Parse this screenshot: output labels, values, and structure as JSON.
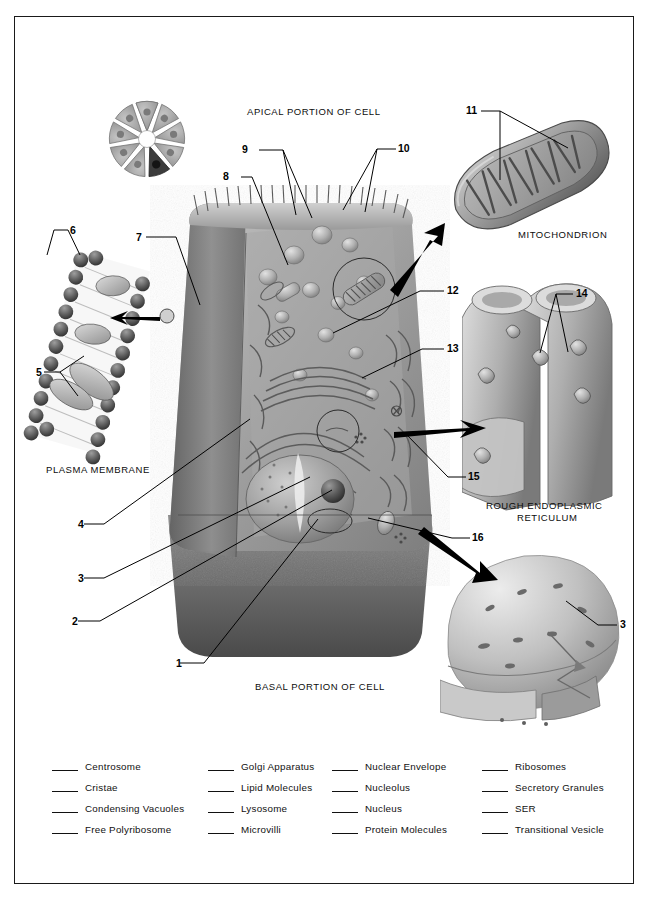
{
  "figure": {
    "orientation_labels": {
      "apical": "APICAL PORTION OF CELL",
      "basal": "BASAL PORTION OF CELL"
    },
    "inset_titles": {
      "mitochondrion": "MITOCHONDRION",
      "plasma_membrane": "PLASMA MEMBRANE",
      "rough_er_line1": "ROUGH ENDOPLASMIC",
      "rough_er_line2": "RETICULUM"
    },
    "callouts": [
      {
        "id": "1",
        "text": "1"
      },
      {
        "id": "2",
        "text": "2"
      },
      {
        "id": "3",
        "text": "3"
      },
      {
        "id": "4",
        "text": "4"
      },
      {
        "id": "5",
        "text": "5"
      },
      {
        "id": "6",
        "text": "6"
      },
      {
        "id": "7",
        "text": "7"
      },
      {
        "id": "8",
        "text": "8"
      },
      {
        "id": "9",
        "text": "9"
      },
      {
        "id": "10",
        "text": "10"
      },
      {
        "id": "11",
        "text": "11"
      },
      {
        "id": "12",
        "text": "12"
      },
      {
        "id": "13",
        "text": "13"
      },
      {
        "id": "14",
        "text": "14"
      },
      {
        "id": "15",
        "text": "15"
      },
      {
        "id": "16",
        "text": "16"
      },
      {
        "id": "3b",
        "text": "3"
      }
    ]
  },
  "legend": {
    "columns": [
      {
        "items": [
          {
            "label": "Centrosome"
          },
          {
            "label": "Cristae"
          },
          {
            "label": "Condensing Vacuoles"
          },
          {
            "label": "Free Polyribosome"
          }
        ]
      },
      {
        "items": [
          {
            "label": "Golgi Apparatus"
          },
          {
            "label": "Lipid Molecules"
          },
          {
            "label": "Lysosome"
          },
          {
            "label": "Microvilli"
          }
        ]
      },
      {
        "items": [
          {
            "label": "Nuclear Envelope"
          },
          {
            "label": "Nucleolus"
          },
          {
            "label": "Nucleus"
          },
          {
            "label": "Protein Molecules"
          }
        ]
      },
      {
        "items": [
          {
            "label": "Ribosomes"
          },
          {
            "label": "Secretory Granules"
          },
          {
            "label": "SER"
          },
          {
            "label": "Transitional Vesicle"
          }
        ]
      }
    ]
  },
  "colors": {
    "ink": "#111111",
    "frame": "#1a1a1a",
    "page": "#ffffff",
    "cell_light": "#b8b8b8",
    "cell_mid": "#949494",
    "cell_dark": "#6d6d6d",
    "cell_shadow": "#4e4e4e",
    "organelle_hi": "#d6d6d6"
  }
}
